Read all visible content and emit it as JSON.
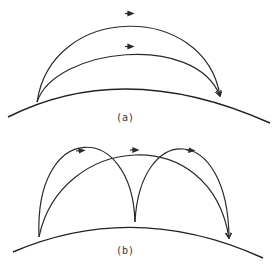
{
  "figure": {
    "panels": [
      {
        "id": "a",
        "label": "(a)",
        "description": "Two trajectories of different heights from the same left launch point to the same right landing point over a curved surface",
        "trajectories": 2
      },
      {
        "id": "b",
        "label": "(b)",
        "description": "One long trajectory and two shorter hops (left-to-middle, middle-to-right) over a curved surface",
        "trajectories": 3
      }
    ],
    "colors": {
      "line": "#2a2a2a",
      "background": "#ffffff"
    }
  }
}
